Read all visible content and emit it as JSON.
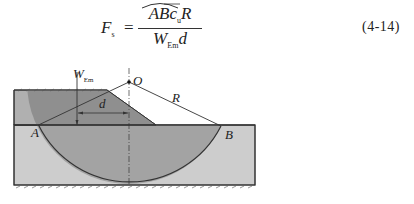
{
  "equation": {
    "lhs": "F",
    "lhs_sub": "s",
    "equals": "=",
    "numerator_main": "ABc",
    "numerator_sub": "u",
    "numerator_tail": "R",
    "arc_over": "AB",
    "denominator_main": "W",
    "denominator_sub": "Em",
    "denominator_tail": "d",
    "number": "(4-14)"
  },
  "figure": {
    "labels": {
      "weight": "W",
      "weight_sub": "Em",
      "center": "O",
      "radius": "R",
      "lever_arm": "d",
      "point_a": "A",
      "point_b": "B"
    },
    "colors": {
      "embankment": "#8f8f8f",
      "sliding_mass": "#9a9a9a",
      "foundation": "#cdcdcd",
      "outline": "#333333"
    }
  }
}
